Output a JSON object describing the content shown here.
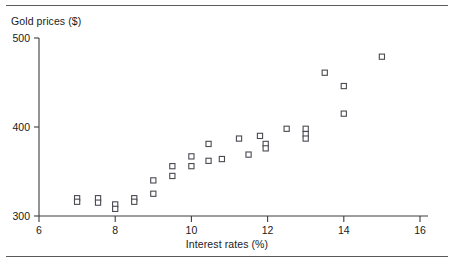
{
  "figure": {
    "name": "gold-prices-vs-interest-rates-scatter",
    "rules": {
      "top": true,
      "bottom": true
    }
  },
  "chart_data": {
    "type": "scatter",
    "title": "",
    "xlabel": "Interest rates (%)",
    "ylabel": "Gold prices ($)",
    "xlim": [
      6,
      16
    ],
    "ylim": [
      300,
      500
    ],
    "xticks": [
      6,
      8,
      10,
      12,
      14,
      16
    ],
    "yticks": [
      300,
      400,
      500
    ],
    "xtick_labels": [
      "6",
      "8",
      "10",
      "12",
      "14",
      "16"
    ],
    "ytick_labels": [
      "300",
      "400",
      "500"
    ],
    "grid": false,
    "legend": null,
    "marker": "open-square",
    "series": [
      {
        "name": "Gold price observations",
        "points": [
          {
            "x": 7.0,
            "y": 320
          },
          {
            "x": 7.0,
            "y": 316
          },
          {
            "x": 7.55,
            "y": 320
          },
          {
            "x": 7.55,
            "y": 315
          },
          {
            "x": 8.0,
            "y": 313
          },
          {
            "x": 8.0,
            "y": 308
          },
          {
            "x": 8.5,
            "y": 320
          },
          {
            "x": 8.5,
            "y": 316
          },
          {
            "x": 9.0,
            "y": 340
          },
          {
            "x": 9.0,
            "y": 325
          },
          {
            "x": 9.5,
            "y": 356
          },
          {
            "x": 9.5,
            "y": 345
          },
          {
            "x": 10.0,
            "y": 367
          },
          {
            "x": 10.0,
            "y": 356
          },
          {
            "x": 10.45,
            "y": 381
          },
          {
            "x": 10.45,
            "y": 362
          },
          {
            "x": 10.8,
            "y": 364
          },
          {
            "x": 11.25,
            "y": 387
          },
          {
            "x": 11.5,
            "y": 369
          },
          {
            "x": 11.8,
            "y": 390
          },
          {
            "x": 11.95,
            "y": 381
          },
          {
            "x": 11.95,
            "y": 376
          },
          {
            "x": 12.5,
            "y": 398
          },
          {
            "x": 13.0,
            "y": 398
          },
          {
            "x": 13.0,
            "y": 392
          },
          {
            "x": 13.0,
            "y": 387
          },
          {
            "x": 13.5,
            "y": 461
          },
          {
            "x": 14.0,
            "y": 446
          },
          {
            "x": 14.0,
            "y": 415
          },
          {
            "x": 15.0,
            "y": 479
          }
        ]
      }
    ]
  }
}
